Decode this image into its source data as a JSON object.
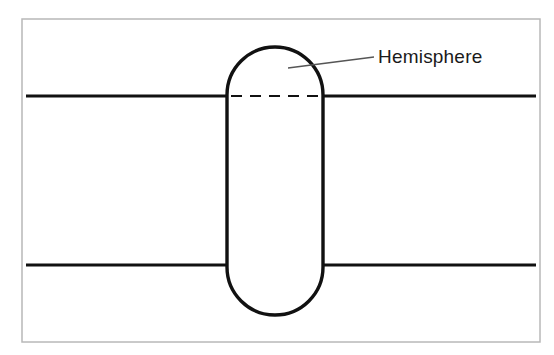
{
  "figure": {
    "title": "",
    "background_color": "#ffffff",
    "frame": {
      "name": "image-border",
      "color": "#b8b8b8",
      "x": 22,
      "y": 19,
      "width": 518,
      "height": 323,
      "stroke_width": 1.5
    },
    "annotations": [
      {
        "id": "hemisphere",
        "label": "Hemisphere",
        "text_x": 378,
        "text_y": 63,
        "leader": {
          "from_x": 288,
          "from_y": 68,
          "to_x": 374,
          "to_y": 57,
          "color": "#555555",
          "stroke_width": 1.4
        }
      }
    ],
    "shapes": {
      "band": {
        "name": "horizontal-band",
        "color": "#111111",
        "stroke_width": 3.2,
        "top_line": {
          "x1": 26,
          "y1": 96,
          "x2": 536,
          "y2": 96
        },
        "bottom_line": {
          "x1": 26,
          "y1": 265,
          "x2": 536,
          "y2": 265
        }
      },
      "capsule": {
        "name": "capsule-boss",
        "color": "#111111",
        "fill": "#ffffff",
        "stroke_width": 3.4,
        "left_x": 227,
        "right_x": 323,
        "top_y": 47,
        "bottom_y": 315,
        "cap_radius": 48
      },
      "dashed_center": {
        "name": "hemisphere-parting-line",
        "color": "#111111",
        "stroke_width": 2.2,
        "dash": "11 8",
        "x1": 231,
        "y1": 96,
        "x2": 320,
        "y2": 96
      }
    }
  }
}
